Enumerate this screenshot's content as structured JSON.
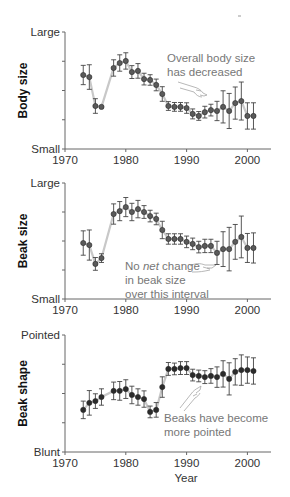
{
  "figure": {
    "x_axis_label": "Year",
    "colors": {
      "point_fill": "#5a5a5a",
      "point_stroke": "#2a2a2a",
      "error_bar": "#444444",
      "connecting_line": "#c8c8c8",
      "axis": "#666666",
      "annotation_text": "#777777",
      "beak_shape_point_fill": "#2b2b2b"
    }
  },
  "chart_data": [
    {
      "type": "scatter",
      "title": "",
      "ylabel": "Body size",
      "xlabel": "",
      "x_ticks": [
        1970,
        1980,
        1990,
        2000
      ],
      "xlim": [
        1970,
        2004
      ],
      "ylim": [
        0,
        4
      ],
      "y_tick_labels": {
        "top": "Large",
        "bottom": "Small"
      },
      "y_minor_ticks": [
        1,
        2,
        3
      ],
      "annotation": [
        "Overall body size",
        "has decreased"
      ],
      "series": [
        {
          "name": "Body size",
          "x": [
            1973,
            1974,
            1975,
            1976,
            1978,
            1979,
            1980,
            1981,
            1982,
            1983,
            1984,
            1985,
            1986,
            1987,
            1988,
            1989,
            1990,
            1991,
            1992,
            1993,
            1994,
            1995,
            1996,
            1997,
            1998,
            1999,
            2000,
            2001
          ],
          "values": [
            2.53,
            2.46,
            1.47,
            1.44,
            2.77,
            2.94,
            3.01,
            2.63,
            2.67,
            2.39,
            2.36,
            2.19,
            1.88,
            1.47,
            1.44,
            1.44,
            1.4,
            1.2,
            1.13,
            1.26,
            1.33,
            1.3,
            1.44,
            1.3,
            1.57,
            1.64,
            1.13,
            1.13
          ],
          "error": [
            0.33,
            0.42,
            0.25,
            0.0,
            0.28,
            0.28,
            0.28,
            0.22,
            0.25,
            0.2,
            0.18,
            0.2,
            0.25,
            0.15,
            0.15,
            0.15,
            0.18,
            0.17,
            0.15,
            0.2,
            0.2,
            0.33,
            0.55,
            0.6,
            0.55,
            0.65,
            0.45,
            0.45
          ]
        }
      ]
    },
    {
      "type": "scatter",
      "title": "",
      "ylabel": "Beak size",
      "xlabel": "",
      "x_ticks": [
        1970,
        1980,
        1990,
        2000
      ],
      "xlim": [
        1970,
        2004
      ],
      "ylim": [
        0,
        4
      ],
      "y_tick_labels": {
        "top": "Large",
        "bottom": "Small"
      },
      "y_minor_ticks": [
        1,
        2,
        3
      ],
      "annotation": [
        "No net change",
        "in beak size",
        "over this interval"
      ],
      "annotation_italic_word": "net",
      "series": [
        {
          "name": "Beak size",
          "x": [
            1973,
            1974,
            1975,
            1976,
            1978,
            1979,
            1980,
            1981,
            1982,
            1983,
            1984,
            1985,
            1986,
            1987,
            1988,
            1989,
            1990,
            1991,
            1992,
            1993,
            1994,
            1995,
            1996,
            1997,
            1998,
            1999,
            2000,
            2001
          ],
          "values": [
            1.93,
            1.86,
            1.21,
            1.41,
            2.93,
            3.03,
            3.17,
            3.0,
            3.1,
            3.0,
            2.86,
            2.76,
            2.38,
            2.07,
            2.07,
            2.07,
            1.97,
            1.9,
            1.79,
            1.83,
            1.83,
            1.59,
            1.72,
            1.72,
            1.97,
            2.14,
            1.76,
            1.76
          ],
          "error": [
            0.42,
            0.52,
            0.22,
            0.15,
            0.35,
            0.33,
            0.33,
            0.3,
            0.3,
            0.22,
            0.2,
            0.2,
            0.3,
            0.18,
            0.18,
            0.18,
            0.2,
            0.2,
            0.2,
            0.23,
            0.23,
            0.4,
            0.6,
            0.75,
            0.6,
            0.72,
            0.5,
            0.52
          ]
        }
      ]
    },
    {
      "type": "scatter",
      "title": "",
      "ylabel": "Beak shape",
      "xlabel": "Year",
      "x_ticks": [
        1970,
        1980,
        1990,
        2000
      ],
      "xlim": [
        1970,
        2004
      ],
      "ylim": [
        0,
        4
      ],
      "y_tick_labels": {
        "top": "Pointed",
        "bottom": "Blunt"
      },
      "y_minor_ticks": [
        1,
        2,
        3
      ],
      "annotation": [
        "Beaks have become",
        "more pointed"
      ],
      "series": [
        {
          "name": "Beak shape",
          "x": [
            1973,
            1974,
            1975,
            1976,
            1978,
            1979,
            1980,
            1981,
            1982,
            1983,
            1984,
            1985,
            1986,
            1987,
            1988,
            1989,
            1990,
            1991,
            1992,
            1993,
            1994,
            1995,
            1996,
            1997,
            1998,
            1999,
            2000,
            2001
          ],
          "values": [
            1.44,
            1.68,
            1.74,
            1.88,
            2.09,
            2.09,
            2.15,
            1.95,
            1.88,
            1.81,
            1.37,
            1.44,
            2.22,
            2.84,
            2.84,
            2.87,
            2.87,
            2.63,
            2.6,
            2.56,
            2.6,
            2.56,
            2.67,
            2.5,
            2.74,
            2.8,
            2.8,
            2.77
          ],
          "error": [
            0.3,
            0.42,
            0.25,
            0.28,
            0.3,
            0.32,
            0.32,
            0.3,
            0.28,
            0.28,
            0.2,
            0.25,
            0.35,
            0.22,
            0.2,
            0.22,
            0.22,
            0.2,
            0.2,
            0.22,
            0.25,
            0.35,
            0.45,
            0.55,
            0.45,
            0.52,
            0.45,
            0.45
          ]
        }
      ]
    }
  ]
}
